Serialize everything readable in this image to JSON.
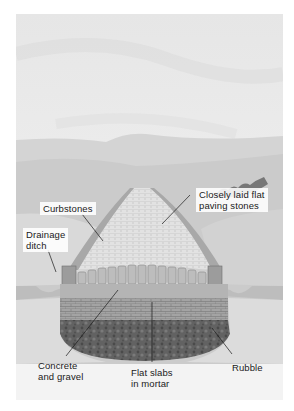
{
  "figure": {
    "labels": {
      "curbstones": [
        "Curbstones"
      ],
      "drainage_ditch": [
        "Drainage",
        "ditch"
      ],
      "paving_stones": [
        "Closely laid flat",
        "paving stones"
      ],
      "concrete_gravel": [
        "Concrete",
        "and gravel"
      ],
      "flat_slabs": [
        "Flat slabs",
        "in mortar"
      ],
      "rubble": [
        "Rubble"
      ]
    },
    "colors": {
      "sky": "#ececec",
      "hills": "#d6d6d6",
      "road_surface": "#d8d8d8",
      "slab_layer": "#9a9a9a",
      "rubble_layer": "#5e5e5e",
      "label_text": "#1a1a1a"
    }
  }
}
